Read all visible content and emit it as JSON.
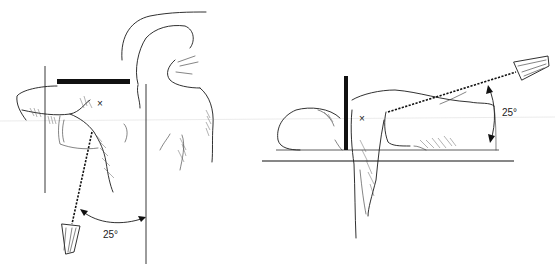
{
  "figure": {
    "type": "positioning-illustration",
    "panels": [
      {
        "id": "left",
        "view": "posterior view, arm abducted on detector",
        "angle_label": "25°",
        "marker_label": "×"
      },
      {
        "id": "right",
        "view": "lateral view, patient lying on table",
        "angle_label": "25°",
        "marker_label": "×"
      }
    ]
  }
}
